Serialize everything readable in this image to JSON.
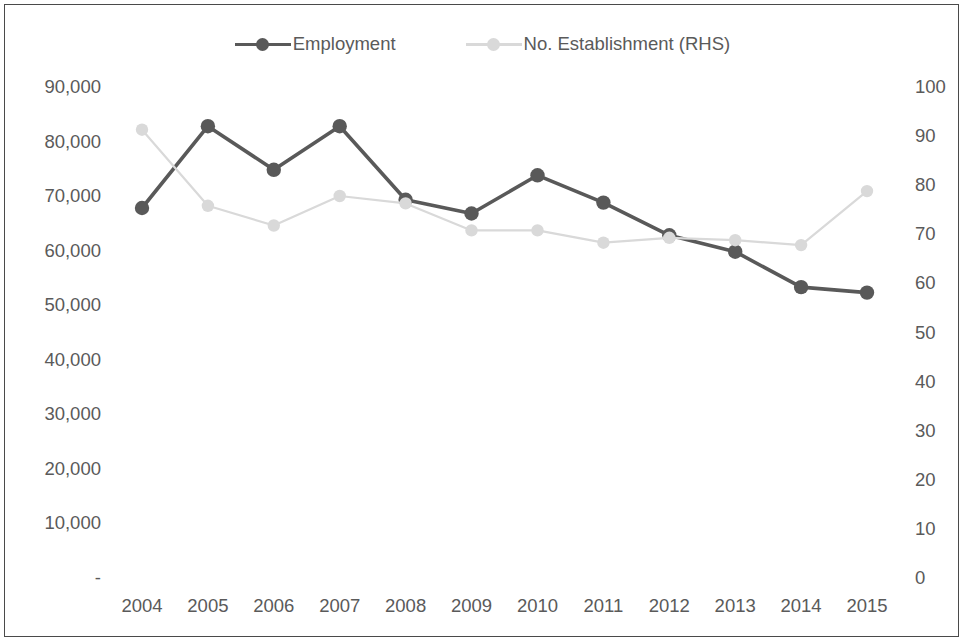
{
  "legend": {
    "items": [
      {
        "label": "Employment",
        "color": "#595959",
        "marker": "circle"
      },
      {
        "label": "No. Establishment (RHS)",
        "color": "#d9d9d9",
        "marker": "circle"
      }
    ]
  },
  "axes": {
    "left_ticks": [
      "90,000",
      "80,000",
      "70,000",
      "60,000",
      "50,000",
      "40,000",
      "30,000",
      "20,000",
      "10,000",
      "-"
    ],
    "right_ticks": [
      "100",
      "90",
      "80",
      "70",
      "60",
      "50",
      "40",
      "30",
      "20",
      "10",
      "0"
    ],
    "x_ticks": [
      "2004",
      "2005",
      "2006",
      "2007",
      "2008",
      "2009",
      "2010",
      "2011",
      "2012",
      "2013",
      "2014",
      "2015"
    ]
  },
  "chart_data": {
    "type": "line",
    "title": "",
    "xlabel": "",
    "ylabel": "",
    "y2label": "",
    "categories": [
      "2004",
      "2005",
      "2006",
      "2007",
      "2008",
      "2009",
      "2010",
      "2011",
      "2012",
      "2013",
      "2014",
      "2015"
    ],
    "series": [
      {
        "name": "Employment",
        "axis": "left",
        "color": "#595959",
        "values": [
          68000,
          83000,
          75000,
          83000,
          69500,
          67000,
          74000,
          69000,
          63000,
          60000,
          53500,
          52500
        ]
      },
      {
        "name": "No. Establishment (RHS)",
        "axis": "right",
        "color": "#d9d9d9",
        "values": [
          91.5,
          76,
          72,
          78,
          76.5,
          71,
          71,
          68.5,
          69.5,
          69,
          68,
          79
        ]
      }
    ],
    "ylim": [
      0,
      90000
    ],
    "y2lim": [
      0,
      100
    ],
    "ytick_step": 10000,
    "y2tick_step": 10,
    "grid": false,
    "legend_position": "top"
  },
  "style": {
    "border_color": "#4a4a4a",
    "text_color": "#5a5a5a",
    "background": "#ffffff"
  }
}
